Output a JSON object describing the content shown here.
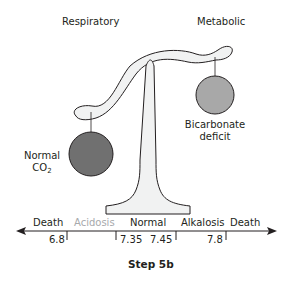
{
  "labels": {
    "respiratory": "Respiratory",
    "metabolic": "Metabolic",
    "left_weight_line1": "Normal",
    "left_weight_line2_main": "CO",
    "left_weight_line2_sub": "2",
    "right_weight_line1": "Bicarbonate",
    "right_weight_line2": "deficit",
    "caption": "Step 5b"
  },
  "scale": {
    "zones": [
      "Death",
      "Acidosis",
      "Normal",
      "Alkalosis",
      "Death"
    ],
    "ticks": [
      "6.8",
      "7.35",
      "7.45",
      "7.8"
    ]
  },
  "colors": {
    "left_weight": "#707070",
    "right_weight": "#a8a8a8",
    "beam_fill": "#f1f2f2",
    "muted_text": "#a7a9ac",
    "ink": "#231f20"
  }
}
